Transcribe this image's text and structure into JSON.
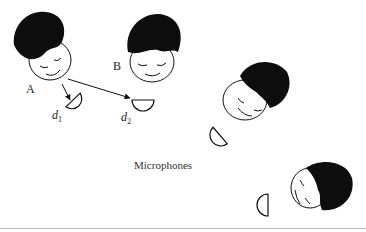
{
  "figure": {
    "caption": "Microphones",
    "speakers": [
      {
        "id": "A",
        "label": "A"
      },
      {
        "id": "B",
        "label": "B"
      },
      {
        "id": "C",
        "label": ""
      },
      {
        "id": "D",
        "label": ""
      }
    ],
    "distances": [
      {
        "label": "d",
        "subscript": "1"
      },
      {
        "label": "d",
        "subscript": "2"
      }
    ],
    "colors": {
      "ink": "#111111",
      "hair": "#0d0d0d",
      "background": "#ffffff"
    }
  }
}
